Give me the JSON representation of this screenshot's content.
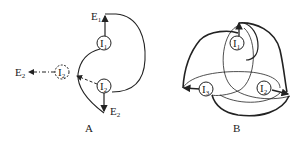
{
  "panels": [
    {
      "caption": "A",
      "nodes": [
        {
          "id": "I1",
          "label": "I",
          "sub": "1",
          "style": "solid"
        },
        {
          "id": "I2",
          "label": "I",
          "sub": "2",
          "style": "solid"
        },
        {
          "id": "I2_image",
          "label": "I",
          "sub": "2",
          "style": "dashed"
        }
      ],
      "terminals": [
        {
          "label": "E",
          "sub": "1"
        },
        {
          "label": "E",
          "sub": "2"
        },
        {
          "label": "E",
          "sub": "2",
          "position": "left-dashed"
        }
      ]
    },
    {
      "caption": "B",
      "nodes": [
        {
          "id": "I1",
          "label": "I",
          "sub": "1"
        },
        {
          "id": "I2",
          "label": "I",
          "sub": "2"
        },
        {
          "id": "I3",
          "label": "I",
          "sub": "3"
        }
      ]
    }
  ],
  "colors": {
    "stroke": "#222222",
    "background": "#ffffff"
  }
}
